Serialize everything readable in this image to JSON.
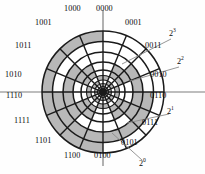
{
  "figure": {
    "type": "polar-sector-diagram"
  },
  "colors": {
    "shaded": "#b8b8b8",
    "unshaded": "#ffffff",
    "stroke": "#1a1a1a",
    "axis": "#7d7d7d",
    "leader": "#8a8a8a",
    "text": "#0a0a0a",
    "background": "#fefefe"
  },
  "geometry": {
    "center_x": 103,
    "center_y": 92,
    "outer_radius": 61,
    "sectors": 16,
    "sector_degrees": 22.5,
    "ring_radii": [
      61,
      50.5,
      40,
      30,
      22,
      16.5,
      12,
      8.5,
      5.5,
      3.2
    ],
    "code_ring_radii": [
      61,
      50.5,
      40,
      30,
      22
    ],
    "axis_h": {
      "x1": 0,
      "x2": 205,
      "y": 92
    },
    "axis_v": {
      "x": 103,
      "y1": 10,
      "y2": 166
    }
  },
  "chart_data": {
    "type": "heatmap",
    "categories": [
      "0000",
      "0001",
      "0011",
      "0010",
      "0110",
      "0111",
      "0101",
      "0100",
      "1100",
      "1101",
      "1111",
      "1110",
      "1010",
      "1011",
      "1001",
      "1000"
    ],
    "series": [
      {
        "name": "2^3",
        "values": [
          0,
          0,
          0,
          0,
          0,
          0,
          0,
          0,
          1,
          1,
          1,
          1,
          1,
          1,
          1,
          1
        ]
      },
      {
        "name": "2^2",
        "values": [
          0,
          0,
          0,
          0,
          1,
          1,
          1,
          1,
          1,
          1,
          1,
          1,
          0,
          0,
          0,
          0
        ]
      },
      {
        "name": "2^1",
        "values": [
          0,
          0,
          1,
          1,
          1,
          1,
          0,
          0,
          0,
          0,
          1,
          1,
          1,
          1,
          0,
          0
        ]
      },
      {
        "name": "2^0",
        "values": [
          0,
          1,
          1,
          0,
          0,
          1,
          1,
          0,
          0,
          1,
          1,
          0,
          0,
          1,
          1,
          0
        ]
      }
    ],
    "legend": [
      "2^3",
      "2^2",
      "2^1",
      "2^0"
    ],
    "grid": true
  },
  "sector_codes": [
    {
      "code": "0000",
      "angle_deg": 11.25,
      "bits": [
        0,
        0,
        0,
        0
      ]
    },
    {
      "code": "0001",
      "angle_deg": 33.75,
      "bits": [
        0,
        0,
        0,
        1
      ]
    },
    {
      "code": "0011",
      "angle_deg": 56.25,
      "bits": [
        0,
        0,
        1,
        1
      ]
    },
    {
      "code": "0010",
      "angle_deg": 78.75,
      "bits": [
        0,
        0,
        1,
        0
      ]
    },
    {
      "code": "0110",
      "angle_deg": 101.25,
      "bits": [
        0,
        1,
        1,
        0
      ]
    },
    {
      "code": "0111",
      "angle_deg": 123.75,
      "bits": [
        0,
        1,
        1,
        1
      ]
    },
    {
      "code": "0101",
      "angle_deg": 146.25,
      "bits": [
        0,
        1,
        0,
        1
      ]
    },
    {
      "code": "0100",
      "angle_deg": 168.75,
      "bits": [
        0,
        1,
        0,
        0
      ]
    },
    {
      "code": "1100",
      "angle_deg": 191.25,
      "bits": [
        1,
        1,
        0,
        0
      ]
    },
    {
      "code": "1101",
      "angle_deg": 213.75,
      "bits": [
        1,
        1,
        0,
        1
      ]
    },
    {
      "code": "1111",
      "angle_deg": 236.25,
      "bits": [
        1,
        1,
        1,
        1
      ]
    },
    {
      "code": "1110",
      "angle_deg": 258.75,
      "bits": [
        1,
        1,
        1,
        0
      ]
    },
    {
      "code": "1010",
      "angle_deg": 281.25,
      "bits": [
        1,
        0,
        1,
        0
      ]
    },
    {
      "code": "1011",
      "angle_deg": 303.75,
      "bits": [
        1,
        0,
        1,
        1
      ]
    },
    {
      "code": "1001",
      "angle_deg": 326.25,
      "bits": [
        1,
        0,
        0,
        1
      ]
    },
    {
      "code": "1000",
      "angle_deg": 348.75,
      "bits": [
        1,
        0,
        0,
        0
      ]
    }
  ],
  "code_labels": [
    {
      "id": "code-0000",
      "text": "0000",
      "x": 106,
      "y": 8
    },
    {
      "id": "code-0001",
      "text": "0001",
      "x": 135,
      "y": 22
    },
    {
      "id": "code-0011",
      "text": "0011",
      "x": 155,
      "y": 45
    },
    {
      "id": "code-0010",
      "text": "0010",
      "x": 160,
      "y": 74
    },
    {
      "id": "code-0110",
      "text": "0110",
      "x": 160,
      "y": 95
    },
    {
      "id": "code-0111",
      "text": "0111",
      "x": 152,
      "y": 122
    },
    {
      "id": "code-0101",
      "text": "0101",
      "x": 131,
      "y": 142
    },
    {
      "id": "code-0100",
      "text": "0100",
      "x": 104,
      "y": 155
    },
    {
      "id": "code-1100",
      "text": "1100",
      "x": 74,
      "y": 155
    },
    {
      "id": "code-1101",
      "text": "1101",
      "x": 45,
      "y": 140
    },
    {
      "id": "code-1111",
      "text": "1111",
      "x": 24,
      "y": 120
    },
    {
      "id": "code-1110",
      "text": "1110",
      "x": 16,
      "y": 95
    },
    {
      "id": "code-1010",
      "text": "1010",
      "x": 15,
      "y": 74
    },
    {
      "id": "code-1011",
      "text": "1011",
      "x": 25,
      "y": 45
    },
    {
      "id": "code-1001",
      "text": "1001",
      "x": 45,
      "y": 22
    },
    {
      "id": "code-1000",
      "text": "1000",
      "x": 74,
      "y": 8
    }
  ],
  "power_labels": [
    {
      "id": "power-2-3",
      "base": "2",
      "exp": "3",
      "x": 173,
      "y": 33,
      "leader": {
        "x1": 171,
        "y1": 39,
        "x2": 122,
        "y2": 64
      }
    },
    {
      "id": "power-2-2",
      "base": "2",
      "exp": "2",
      "x": 181,
      "y": 61,
      "leader": {
        "x1": 179,
        "y1": 67,
        "x2": 130,
        "y2": 81
      }
    },
    {
      "id": "power-2-1",
      "base": "2",
      "exp": "1",
      "x": 171,
      "y": 111,
      "leader": {
        "x1": 169,
        "y1": 114,
        "x2": 127,
        "y2": 123
      }
    },
    {
      "id": "power-2-0",
      "base": "2",
      "exp": "0",
      "x": 143,
      "y": 163,
      "leader": {
        "x1": 142,
        "y1": 160,
        "x2": 112,
        "y2": 133
      }
    }
  ]
}
